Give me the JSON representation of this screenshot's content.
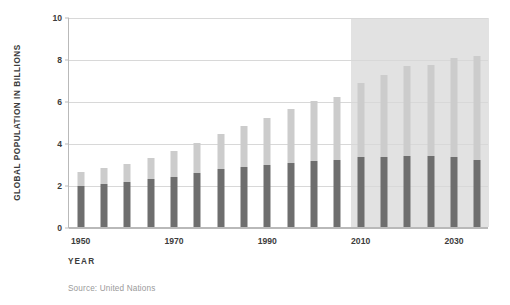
{
  "chart_data": {
    "type": "bar",
    "title": "",
    "subtitle": "",
    "xlabel": "YEAR",
    "ylabel": "GLOBAL POPULATION IN BILLIONS",
    "source": "Source: United Nations",
    "ylim": [
      0,
      10
    ],
    "yticks": [
      0,
      2,
      4,
      6,
      8,
      10
    ],
    "ytick_labels": [
      "0",
      "2",
      "4",
      "6",
      "8",
      "10"
    ],
    "xlim": [
      1947.5,
      2037.5
    ],
    "xticks": [
      1950,
      1970,
      1990,
      2010,
      2030
    ],
    "xtick_labels": [
      "1950",
      "1970",
      "1990",
      "2010",
      "2030"
    ],
    "grid": true,
    "legend": "none",
    "stacked": true,
    "categories": [
      1950,
      1955,
      1960,
      1965,
      1970,
      1975,
      1980,
      1985,
      1990,
      1995,
      2000,
      2005,
      2010,
      2015,
      2020,
      2025,
      2030,
      2035
    ],
    "series": [
      {
        "name": "lower-segment",
        "color": "#6e6e6e",
        "values": [
          1.95,
          2.05,
          2.15,
          2.3,
          2.4,
          2.55,
          2.75,
          2.85,
          2.95,
          3.05,
          3.15,
          3.2,
          3.35,
          3.35,
          3.4,
          3.4,
          3.35,
          3.2
        ]
      },
      {
        "name": "upper-segment",
        "color": "#cccccc",
        "values": [
          0.65,
          0.75,
          0.85,
          1.0,
          1.2,
          1.45,
          1.7,
          1.95,
          2.25,
          2.55,
          2.85,
          3.0,
          3.5,
          3.9,
          4.25,
          4.3,
          4.7,
          4.95
        ]
      }
    ],
    "totals": [
      2.6,
      2.8,
      3.0,
      3.3,
      3.6,
      4.0,
      4.45,
      4.8,
      5.2,
      5.6,
      6.0,
      6.2,
      6.85,
      7.25,
      7.65,
      7.7,
      8.05,
      8.15
    ],
    "projection_band": {
      "label": "projection",
      "start_year": 2008,
      "end_year": 2037.5,
      "color": "#e2e2e2"
    },
    "colors": {
      "lower": "#6e6e6e",
      "upper": "#cccccc",
      "grid": "#d8d8d8",
      "axis": "#b9b9b9",
      "text": "#3c3c3c",
      "source_text": "#9a9a9a",
      "background": "#ffffff"
    }
  }
}
